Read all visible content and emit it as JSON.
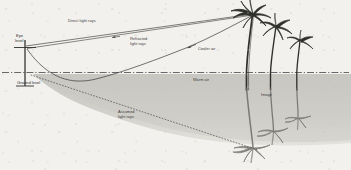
{
  "diagram": {
    "background_color": "#f2f1ee",
    "ink_color": "#3a3a38",
    "shade_color": "#c9c8c2",
    "labels": {
      "eye_level_line1": "Eye",
      "eye_level_line2": "level",
      "ground_level": "Ground level",
      "direct_rays": "Direct light rays",
      "refracted_rays_line1": "Refracted",
      "refracted_rays_line2": "light rays",
      "assumed_rays_line1": "Assumed",
      "assumed_rays_line2": "light rays",
      "cooler_air": "Cooler air",
      "warm_air": "Warm air",
      "image": "Image"
    },
    "elements": {
      "observer_eye": "eye-marker",
      "trees": [
        "palm-tree-tall",
        "palm-tree-medium",
        "palm-tree-short"
      ],
      "mirage_trees": [
        "mirage-palm-tall",
        "mirage-palm-medium",
        "mirage-palm-short"
      ],
      "ground_line_style": "dash-dot",
      "assumed_ray_style": "dotted",
      "direct_ray_style": "solid-with-arrow",
      "refracted_ray_style": "solid-curved-with-arrow"
    },
    "geometry": {
      "eye_x": 25,
      "eye_y": 47,
      "ground_y": 72,
      "tree_base_x": 253,
      "tree_top_y": 12
    }
  }
}
